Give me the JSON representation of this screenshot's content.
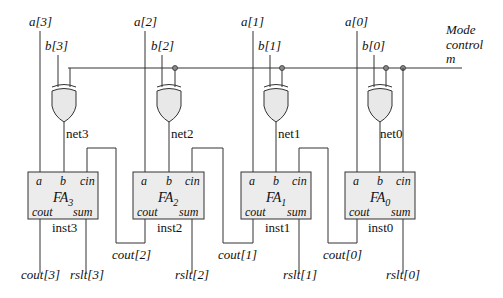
{
  "diagram": {
    "type": "4-bit adder/subtractor circuit",
    "mode_control": {
      "line1": "Mode",
      "line2": "control",
      "line3": "m"
    },
    "inputs_a": [
      "a[3]",
      "a[2]",
      "a[1]",
      "a[0]"
    ],
    "inputs_b": [
      "b[3]",
      "b[2]",
      "b[1]",
      "b[0]"
    ],
    "nets": [
      "net3",
      "net2",
      "net1",
      "net0"
    ],
    "full_adders": [
      {
        "name": "FA",
        "sub": "3",
        "inst": "inst3",
        "ports": {
          "a": "a",
          "b": "b",
          "cin": "cin",
          "cout": "cout",
          "sum": "sum"
        }
      },
      {
        "name": "FA",
        "sub": "2",
        "inst": "inst2",
        "ports": {
          "a": "a",
          "b": "b",
          "cin": "cin",
          "cout": "cout",
          "sum": "sum"
        }
      },
      {
        "name": "FA",
        "sub": "1",
        "inst": "inst1",
        "ports": {
          "a": "a",
          "b": "b",
          "cin": "cin",
          "cout": "cout",
          "sum": "sum"
        }
      },
      {
        "name": "FA",
        "sub": "0",
        "inst": "inst0",
        "ports": {
          "a": "a",
          "b": "b",
          "cin": "cin",
          "cout": "cout",
          "sum": "sum"
        }
      }
    ],
    "carry_outputs": [
      "cout[3]",
      "cout[2]",
      "cout[1]",
      "cout[0]"
    ],
    "result_outputs": [
      "rslt[3]",
      "rslt[2]",
      "rslt[1]",
      "rslt[0]"
    ]
  }
}
